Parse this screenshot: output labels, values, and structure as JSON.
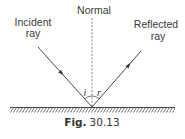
{
  "labels": {
    "normal": "Normal",
    "incident_line1": "Incident",
    "incident_line2": "ray",
    "reflected_line1": "Reflected",
    "reflected_line2": "ray",
    "angle_incidence": "i",
    "angle_reflection": "r"
  },
  "caption": {
    "prefix": "Fig.",
    "number": "30.13"
  },
  "colors": {
    "line": "#333333",
    "text": "#3a3a3a",
    "background": "#ffffff"
  }
}
